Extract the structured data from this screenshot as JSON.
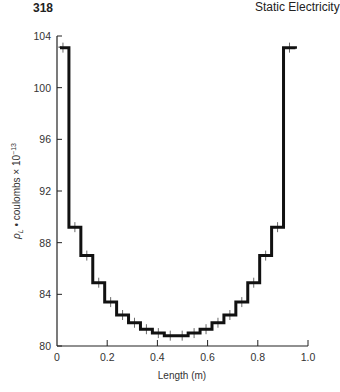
{
  "page": {
    "number": "318",
    "running_head": "Static Electricity"
  },
  "chart_data": {
    "type": "line",
    "style": "step",
    "title": "",
    "xlabel": "Length (m)",
    "ylabel": "ρL • coulombs × 10⁻¹³",
    "ylabel_parts": {
      "rho": "ρ",
      "sub": "L",
      "rest": " • coulombs × 10",
      "exp": "−13"
    },
    "xlim": [
      0,
      1.0
    ],
    "ylim": [
      80,
      104
    ],
    "x_ticks": [
      "0",
      "0.2",
      "0.4",
      "0.6",
      "0.8",
      "1.0"
    ],
    "y_ticks": [
      "80",
      "84",
      "88",
      "92",
      "96",
      "100",
      "104"
    ],
    "grid": false,
    "legend": null,
    "segment_width": 0.0475,
    "x": [
      0,
      0.0475,
      0.095,
      0.1425,
      0.19,
      0.2375,
      0.285,
      0.3325,
      0.38,
      0.4275,
      0.475,
      0.5225,
      0.57,
      0.6175,
      0.665,
      0.7125,
      0.76,
      0.8075,
      0.855,
      0.9025
    ],
    "values": [
      103.1,
      89.2,
      87.0,
      84.9,
      83.4,
      82.4,
      81.8,
      81.3,
      81.0,
      80.8,
      80.8,
      81.0,
      81.3,
      81.8,
      82.4,
      83.4,
      84.9,
      87.0,
      89.2,
      103.1
    ]
  }
}
